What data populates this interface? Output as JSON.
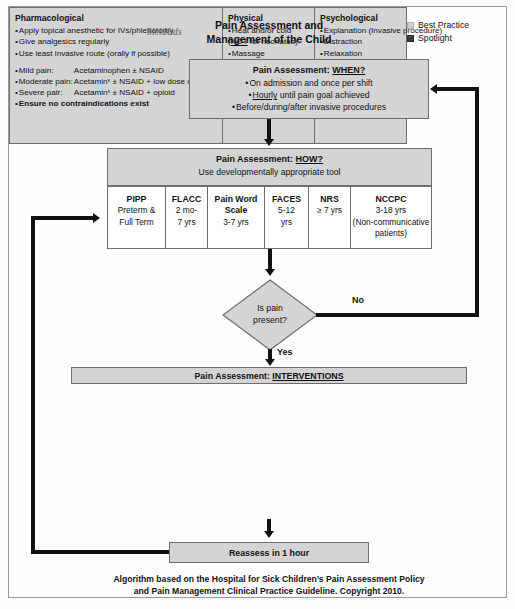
{
  "document": {
    "logo": "SickKids",
    "title_line1": "Pain Assessment and",
    "title_line2": "Management of the Child",
    "footer_line1": "Algorithm based on the Hospital for Sick Children’s Pain Assessment Policy",
    "footer_line2": "and Pain Management Clinical Practice Guideline. Copyright 2010."
  },
  "legend": {
    "items": [
      {
        "label": "Best Practice",
        "swatch": "light-gray-square",
        "color": "#cfcfcf"
      },
      {
        "label": "Spotlight",
        "swatch": "dark-gray-square",
        "color": "#3d3d3d"
      }
    ]
  },
  "when_box": {
    "title_prefix": "Pain Assessment:",
    "title_keyword": "WHEN?",
    "items": [
      "On admission and once per shift",
      "Hourly until pain goal achieved",
      "Before/during/after invasive procedures"
    ],
    "item2_underlined_word": "Hourly"
  },
  "how_box": {
    "title_prefix": "Pain Assessment:",
    "title_keyword": "HOW?",
    "subtitle": "Use developmentally appropriate tool"
  },
  "tools": [
    {
      "name": "PIPP",
      "lines": [
        "Preterm &",
        "Full Term"
      ]
    },
    {
      "name": "FLACC",
      "lines": [
        "2 mo-",
        "7 yrs"
      ]
    },
    {
      "name": "Pain Word Scale",
      "lines": [
        "3-7 yrs"
      ]
    },
    {
      "name": "FACES",
      "lines": [
        "5-12",
        "yrs"
      ]
    },
    {
      "name": "NRS",
      "lines": [
        "≥ 7 yrs"
      ]
    },
    {
      "name": "NCCPC",
      "lines": [
        "3-18 yrs",
        "(Non-communicative",
        "patients)"
      ]
    }
  ],
  "decision": {
    "line1": "Is pain",
    "line2": "present?",
    "yes_label": "Yes",
    "no_label": "No"
  },
  "interventions": {
    "title_prefix": "Pain Assessment:",
    "title_keyword": "INTERVENTIONS",
    "columns": [
      {
        "heading": "Pharmacological",
        "items": [
          {
            "text": "Apply topical anesthetic for IVs/phlebotomy",
            "bullet": true
          },
          {
            "text": "Give analgesics regularly",
            "bullet": true
          },
          {
            "text": "Use least invasive route (orally if possible)",
            "bullet": true
          },
          {
            "gap": true
          },
          {
            "label": "Mild pain:",
            "value": "Acetaminophen ± NSAID",
            "bullet": true
          },
          {
            "label": "Moderate pain:",
            "value": "Acetaminˣ ± NSAID + low dose opioid",
            "bullet": true
          },
          {
            "label": "Severe pair:",
            "value": "Acetaminˣ ± NSAID + opioid",
            "bullet": true
          },
          {
            "text": "Ensure no contraindications exist",
            "bullet": true,
            "bold": true
          }
        ]
      },
      {
        "heading": "Physical",
        "items": [
          {
            "text": "Heat and/or cold",
            "bullet": true
          },
          {
            "text": "(NOT for neonates)",
            "bullet": false,
            "underline_word": "NOT"
          },
          {
            "text": "Massage",
            "bullet": true
          },
          {
            "text": "Pressure",
            "bullet": true
          },
          {
            "text": "Activity out of bed",
            "bullet": true
          },
          {
            "text": "Swaddling (Neonate)",
            "bullet": true
          },
          {
            "text": "Sucrose (< 2yrs)",
            "bullet": true
          }
        ]
      },
      {
        "heading": "Psychological",
        "items": [
          {
            "text": "Explanation (Invasive procedure)",
            "bullet": true
          },
          {
            "text": "Distraction",
            "bullet": true
          },
          {
            "text": "Relaxation",
            "bullet": true
          },
          {
            "gap": true
          },
          {
            "text": "Consider:",
            "bullet": false,
            "underline": true
          },
          {
            "text": "Child Life Specialist",
            "bullet": true
          },
          {
            "text": "Psychology/psychiatry",
            "bullet": true
          },
          {
            "text": "consult for coping strategies",
            "bullet": false
          }
        ]
      }
    ]
  },
  "reassess_box": {
    "label": "Reassess in 1 hour"
  }
}
